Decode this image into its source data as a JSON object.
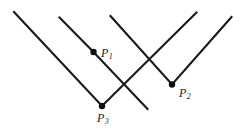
{
  "figure": {
    "background_color": "#ffffff",
    "stroke_color": "#1a1a1a",
    "stroke_width": 2.1,
    "width": 243,
    "height": 133,
    "marker_color": "#101010",
    "marker_radius": 3.2
  },
  "labels": {
    "p1": {
      "base": "P",
      "subscript": "1",
      "text": "P1",
      "x": 101,
      "y": 47
    },
    "p2": {
      "base": "P",
      "subscript": "2",
      "text": "P2",
      "x": 179,
      "y": 87
    },
    "p3": {
      "base": "P",
      "subscript": "3",
      "text": "P3",
      "x": 97,
      "y": 112
    }
  },
  "vertices": [
    {
      "name": "P1",
      "x": 93.5,
      "y": 52.0
    },
    {
      "name": "P2",
      "x": 172.0,
      "y": 84.5
    },
    {
      "name": "P3",
      "x": 102.0,
      "y": 106.0
    }
  ],
  "paths": [
    {
      "name": "chevron-p3",
      "vertex": "P3",
      "points": [
        [
          14.0,
          12.0
        ],
        [
          102.0,
          106.0
        ],
        [
          196.5,
          12.5
        ]
      ]
    },
    {
      "name": "chevron-p1",
      "vertex": "P1",
      "points": [
        [
          59.5,
          17.5
        ],
        [
          93.5,
          52.0
        ],
        [
          147.5,
          109.0
        ]
      ]
    },
    {
      "name": "chevron-p2",
      "vertex": "P2",
      "points": [
        [
          110.5,
          16.0
        ],
        [
          172.0,
          84.5
        ],
        [
          231.5,
          17.0
        ]
      ]
    }
  ],
  "crossings": [
    {
      "name": "crossing-top",
      "x": 118.5,
      "y": 25.0
    },
    {
      "name": "crossing-right",
      "x": 148.5,
      "y": 55.5
    }
  ]
}
